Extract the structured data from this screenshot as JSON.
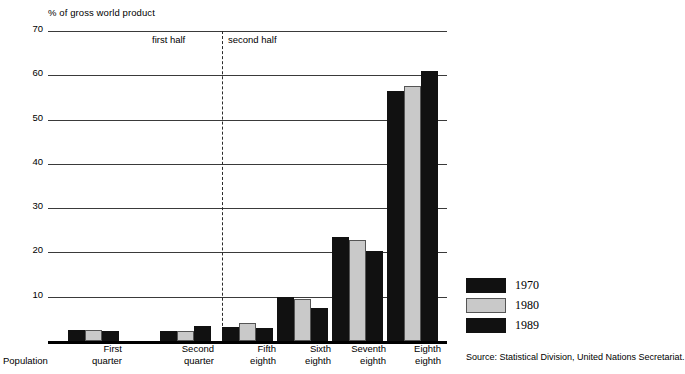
{
  "chart_data": {
    "type": "bar",
    "title": "",
    "ylabel": "% of gross world product",
    "xlabel": "Population",
    "ylim": [
      0,
      70
    ],
    "yticks": [
      0,
      10,
      20,
      30,
      40,
      50,
      60,
      70
    ],
    "grid": true,
    "legend_position": "right",
    "categories": [
      "First quarter",
      "Second quarter",
      "Fifth eighth",
      "Sixth eighth",
      "Seventh eighth",
      "Eighth eighth"
    ],
    "category_lines": [
      [
        "First",
        "quarter"
      ],
      [
        "Second",
        "quarter"
      ],
      [
        "Fifth",
        "eighth"
      ],
      [
        "Sixth",
        "eighth"
      ],
      [
        "Seventh",
        "eighth"
      ],
      [
        "Eighth",
        "eighth"
      ]
    ],
    "series": [
      {
        "name": "1970",
        "color": "#111111",
        "values": [
          2.4,
          2.2,
          3.2,
          9.9,
          23.5,
          56.5
        ]
      },
      {
        "name": "1980",
        "color": "#c9c9c9",
        "values": [
          2.5,
          2.3,
          4.0,
          9.4,
          22.8,
          57.6
        ]
      },
      {
        "name": "1989",
        "color": "#111111",
        "values": [
          2.3,
          3.3,
          2.9,
          7.5,
          20.4,
          61.0
        ]
      }
    ],
    "annotations": [
      {
        "text": "first half",
        "type": "region-label"
      },
      {
        "text": "second half",
        "type": "region-label"
      }
    ],
    "divider": {
      "after_category": "Second quarter",
      "style": "dashed"
    },
    "source": "Source: Statistical Division, United Nations Secretariat."
  },
  "axis": {
    "ylabel": "% of gross world product",
    "zero_label": "0",
    "xlabel": "Population"
  },
  "halves": {
    "first": "first half",
    "second": "second half"
  },
  "legend": {
    "items": [
      {
        "label": "1970"
      },
      {
        "label": "1980"
      },
      {
        "label": "1989"
      }
    ]
  },
  "footer": {
    "source": "Source: Statistical Division, United Nations Secretariat."
  }
}
